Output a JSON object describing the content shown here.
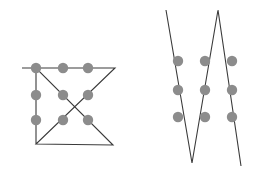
{
  "figure": {
    "background_color": "#ffffff",
    "width": 254,
    "height": 174,
    "dot_color": "#8c8c8c",
    "dot_radius": 5.2,
    "line_color": "#3a3a3a",
    "line_width": 1.1,
    "panels": [
      {
        "name": "left-panel",
        "label": "Four-line solution",
        "dot_grid": {
          "rows": 3,
          "columns": 3,
          "x_positions": [
            36,
            63,
            88
          ],
          "y_positions": [
            68,
            95,
            120
          ],
          "points": [
            {
              "id": "L-r1c1",
              "x": 36,
              "y": 68
            },
            {
              "id": "L-r1c2",
              "x": 63,
              "y": 68
            },
            {
              "id": "L-r1c3",
              "x": 88,
              "y": 68
            },
            {
              "id": "L-r2c1",
              "x": 36,
              "y": 95
            },
            {
              "id": "L-r2c2",
              "x": 63,
              "y": 95
            },
            {
              "id": "L-r2c3",
              "x": 88,
              "y": 95
            },
            {
              "id": "L-r3c1",
              "x": 36,
              "y": 120
            },
            {
              "id": "L-r3c2",
              "x": 63,
              "y": 120
            },
            {
              "id": "L-r3c3",
              "x": 88,
              "y": 120
            }
          ]
        },
        "polyline": {
          "id": "left-solution-path",
          "segment_count": 4,
          "vertices": [
            {
              "x": 22,
              "y": 68
            },
            {
              "x": 115,
              "y": 68
            },
            {
              "x": 36,
              "y": 144
            },
            {
              "x": 113,
              "y": 145
            },
            {
              "x": 36,
              "y": 68
            },
            {
              "x": 36,
              "y": 144
            }
          ],
          "points_attr": "22,68 115,68 36,144 113,145 36,68 36,144"
        }
      },
      {
        "name": "right-panel",
        "label": "Three-line solution",
        "dot_grid": {
          "rows": 3,
          "columns": 3,
          "x_positions": [
            178,
            205,
            232
          ],
          "y_positions": [
            61,
            90,
            117
          ],
          "points": [
            {
              "id": "R-r1c1",
              "x": 178,
              "y": 61
            },
            {
              "id": "R-r1c2",
              "x": 205,
              "y": 61
            },
            {
              "id": "R-r1c3",
              "x": 232,
              "y": 61
            },
            {
              "id": "R-r2c1",
              "x": 178,
              "y": 90
            },
            {
              "id": "R-r2c2",
              "x": 205,
              "y": 90
            },
            {
              "id": "R-r2c3",
              "x": 232,
              "y": 90
            },
            {
              "id": "R-r3c1",
              "x": 178,
              "y": 117
            },
            {
              "id": "R-r3c2",
              "x": 205,
              "y": 117
            },
            {
              "id": "R-r3c3",
              "x": 232,
              "y": 117
            }
          ]
        },
        "polyline": {
          "id": "right-solution-path",
          "segment_count": 3,
          "vertices": [
            {
              "x": 166,
              "y": 10
            },
            {
              "x": 192,
              "y": 163
            },
            {
              "x": 218,
              "y": 10
            },
            {
              "x": 241,
              "y": 166
            }
          ],
          "points_attr": "166,10 192,163 218,10 241,166"
        }
      }
    ]
  }
}
